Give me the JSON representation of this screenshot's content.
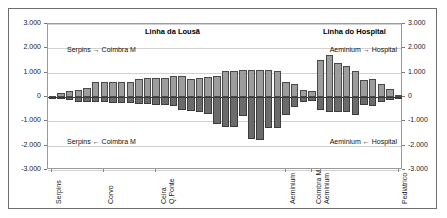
{
  "chart_data": {
    "type": "bar",
    "title": "",
    "xlabel": "",
    "ylabel": "",
    "ylim": [
      -3000,
      3000
    ],
    "grid": true,
    "legend_position": "none",
    "orientation": "vertical",
    "note": "Back-to-back bar chart: positive bars = outbound direction, negative bars = inbound direction, per inter-station section of two railway lines.",
    "y_ticks_left": [
      "3.000",
      "2.000",
      "1.000",
      "0",
      "-1.000",
      "-2.000",
      "-3.000"
    ],
    "y_ticks_right": [
      "3.000",
      "2.000",
      "1.000",
      "0",
      "-1.000",
      "-2.000",
      "-3.000"
    ],
    "y_tick_values": [
      3000,
      2000,
      1000,
      0,
      -1000,
      -2000,
      -3000
    ],
    "sections": [
      {
        "name": "Linha da Lousa",
        "title": "Linha da Lousã"
      },
      {
        "name": "Linha do Hospital",
        "title": "Linha do Hospital"
      }
    ],
    "annotations": [
      {
        "name": "lousa-outbound",
        "text": "Serpins → Coimbra M"
      },
      {
        "name": "lousa-inbound",
        "text": "Serpins ← Coimbra M"
      },
      {
        "name": "hospital-outbound",
        "text": "Aeminium → Hospital"
      },
      {
        "name": "hospital-inbound",
        "text": "Aeminium ← Hospital"
      }
    ],
    "category_ticks": [
      {
        "index": 0,
        "label_lines": [
          "Serpins"
        ]
      },
      {
        "index": 6,
        "label_lines": [
          "Corvo"
        ]
      },
      {
        "index": 12,
        "label_lines": [
          "Ceira",
          "Q.Ponte"
        ]
      },
      {
        "index": 27,
        "label_lines": [
          "Aeminium"
        ]
      },
      {
        "index": 30,
        "label_lines": [
          "Coimbra M"
        ]
      },
      {
        "index": 31,
        "label_lines": [
          "Aeminium"
        ]
      },
      {
        "index": 40,
        "label_lines": [
          "Pediátrico"
        ]
      }
    ],
    "categories": [
      "s0",
      "s1",
      "s2",
      "s3",
      "s4",
      "s5",
      "s6",
      "s7",
      "s8",
      "s9",
      "s10",
      "s11",
      "s12",
      "s13",
      "s14",
      "s15",
      "s16",
      "s17",
      "s18",
      "s19",
      "s20",
      "s21",
      "s22",
      "s23",
      "s24",
      "s25",
      "s26",
      "s27",
      "s28",
      "s29",
      "s30",
      "s31",
      "s32",
      "s33",
      "s34",
      "s35",
      "s36",
      "s37",
      "s38",
      "s39",
      "s40"
    ],
    "series": [
      {
        "name": "Sentido ascendente",
        "section": "both",
        "values": [
          40,
          170,
          250,
          300,
          360,
          600,
          600,
          600,
          620,
          620,
          760,
          780,
          790,
          800,
          860,
          870,
          760,
          800,
          830,
          870,
          1050,
          1060,
          1110,
          1110,
          1110,
          1110,
          1080,
          620,
          520,
          300,
          250,
          1540,
          1720,
          1380,
          1260,
          1060,
          680,
          740,
          520,
          330,
          90
        ]
      },
      {
        "name": "Sentido descendente",
        "section": "both",
        "values": [
          -20,
          -70,
          -130,
          -190,
          -200,
          -210,
          -220,
          -230,
          -250,
          -260,
          -280,
          -300,
          -320,
          -340,
          -360,
          -540,
          -560,
          -620,
          -700,
          -1100,
          -1240,
          -1250,
          -780,
          -1740,
          -1750,
          -1280,
          -1280,
          -760,
          -400,
          -200,
          -180,
          -520,
          -600,
          -620,
          -630,
          -760,
          -330,
          -380,
          -200,
          -120,
          -40
        ]
      }
    ]
  },
  "axis": {
    "left_labels": [
      "3.000",
      "2.000",
      "1.000",
      "0",
      "-1.000",
      "-2.000",
      "-3.000"
    ],
    "right_labels": [
      "3.000",
      "2.000",
      "1.000",
      "0",
      "-1.000",
      "-2.000",
      "-3.000"
    ]
  }
}
